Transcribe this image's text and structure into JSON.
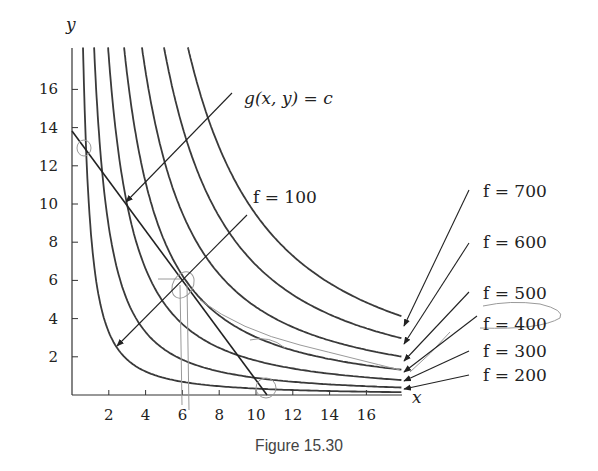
{
  "chart_data": {
    "type": "line",
    "title": "",
    "caption": "Figure 15.30",
    "xlabel": "x",
    "ylabel": "y",
    "xlim": [
      0,
      18
    ],
    "ylim": [
      0,
      18.2
    ],
    "x_ticks": [
      2,
      4,
      6,
      8,
      10,
      12,
      14,
      16
    ],
    "y_ticks": [
      2,
      4,
      6,
      8,
      10,
      12,
      14,
      16
    ],
    "grid": false,
    "legend": "none (labels with arrows on right side)",
    "series": [
      {
        "name": "f = 100",
        "label": "f = 100",
        "curve_type": "level curve",
        "top_x_at_y18": 0.6,
        "end_y_at_x18": 0.16,
        "points": [
          [
            0.6,
            18.2
          ],
          [
            1,
            8.2
          ],
          [
            2.45,
            2.6
          ],
          [
            4,
            1.35
          ],
          [
            6,
            0.75
          ],
          [
            10,
            0.34
          ],
          [
            17.9,
            0.16
          ]
        ]
      },
      {
        "name": "f = 200",
        "label": "f = 200",
        "top_x_at_y18": 1.2,
        "points": [
          [
            1.2,
            18.2
          ],
          [
            2,
            8.5
          ],
          [
            4,
            3.1
          ],
          [
            6,
            1.73
          ],
          [
            10,
            0.82
          ],
          [
            17.9,
            0.35
          ]
        ]
      },
      {
        "name": "f = 300",
        "label": "f = 300",
        "top_x_at_y18": 1.96,
        "points": [
          [
            1.96,
            18.2
          ],
          [
            3,
            9.8
          ],
          [
            5,
            4.5
          ],
          [
            8,
            2.3
          ],
          [
            12,
            1.3
          ],
          [
            17.9,
            0.7
          ]
        ]
      },
      {
        "name": "f = 400",
        "label": "f = 400",
        "top_x_at_y18": 2.83,
        "points": [
          [
            2.83,
            18.2
          ],
          [
            4,
            11.0
          ],
          [
            6,
            6.1
          ],
          [
            10,
            2.9
          ],
          [
            14,
            1.8
          ],
          [
            17.9,
            1.2
          ]
        ]
      },
      {
        "name": "f = 500",
        "label": "f = 500",
        "top_x_at_y18": 3.8,
        "points": [
          [
            3.8,
            18.2
          ],
          [
            5,
            12.1
          ],
          [
            8,
            6.0
          ],
          [
            12,
            3.4
          ],
          [
            17.9,
            1.8
          ]
        ]
      },
      {
        "name": "f = 600",
        "label": "f = 600",
        "top_x_at_y18": 5.0,
        "points": [
          [
            5.0,
            18.2
          ],
          [
            7,
            10.9
          ],
          [
            10,
            6.7
          ],
          [
            14,
            4.2
          ],
          [
            17.9,
            2.9
          ]
        ]
      },
      {
        "name": "f = 700",
        "label": "f = 700",
        "top_x_at_y18": 6.3,
        "points": [
          [
            6.3,
            18.2
          ],
          [
            8,
            12.8
          ],
          [
            11,
            8.0
          ],
          [
            14,
            5.6
          ],
          [
            17.9,
            3.8
          ]
        ]
      },
      {
        "name": "g(x,y) = c",
        "label": "g(x, y) = c",
        "curve_type": "constraint line",
        "points": [
          [
            0,
            13.8
          ],
          [
            10.6,
            0
          ]
        ]
      }
    ],
    "annotations": [
      {
        "text": "g(x, y) = c",
        "arrow_to": [
          3,
          10.1
        ]
      },
      {
        "text": "f = 100",
        "arrow_to": [
          2.45,
          2.6
        ]
      },
      {
        "text": "f = 700",
        "arrow_to_curve_end": true
      },
      {
        "text": "f = 600",
        "arrow_to_curve_end": true
      },
      {
        "text": "f = 500",
        "arrow_to_curve_end": true
      },
      {
        "text": "f = 400",
        "arrow_to_curve_end": true
      },
      {
        "text": "f = 300",
        "arrow_to_curve_end": true
      },
      {
        "text": "f = 200",
        "arrow_to_curve_end": true
      }
    ],
    "tangency_point_approx": [
      6.1,
      6.0
    ]
  },
  "axes": {
    "x_label": "x",
    "y_label": "y",
    "x_ticks": [
      "2",
      "4",
      "6",
      "8",
      "10",
      "12",
      "14",
      "16"
    ],
    "y_ticks": [
      "2",
      "4",
      "6",
      "8",
      "10",
      "12",
      "14",
      "16"
    ]
  },
  "labels": {
    "g_label": "g(x, y) = c",
    "f100": "f = 100",
    "f200": "f = 200",
    "f300": "f = 300",
    "f400": "f = 400",
    "f500": "f = 500",
    "f600": "f = 600",
    "f700": "f = 700"
  },
  "caption": "Figure 15.30",
  "colors": {
    "curve": "#3a3a3a",
    "axis": "#333333",
    "text": "#222222",
    "caption": "#444444",
    "pencil_marks": "#9a9a9a"
  }
}
